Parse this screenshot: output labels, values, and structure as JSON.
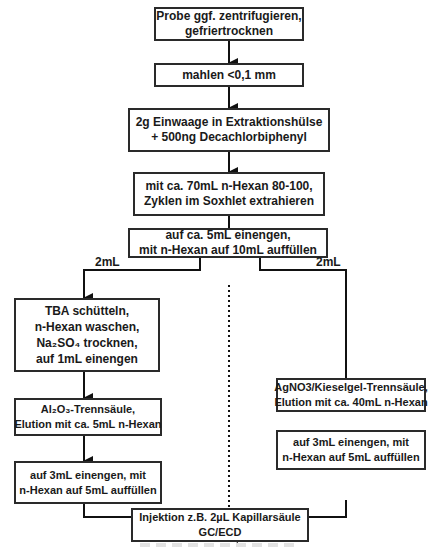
{
  "diagram": {
    "type": "flowchart",
    "steps": {
      "s1": [
        "Probe ggf. zentrifugieren,",
        "gefriertrocknen"
      ],
      "s2": [
        "mahlen <0,1 mm"
      ],
      "s3": [
        "2g Einwaage in Extraktionshülse",
        "+ 500ng Decachlorbiphenyl"
      ],
      "s4": [
        "mit ca. 70mL n-Hexan 80-100,",
        "Zyklen im Soxhlet extrahieren"
      ],
      "s5": [
        "auf ca. 5mL einengen,",
        "mit n-Hexan auf 10mL auffüllen"
      ],
      "left1": [
        "TBA schütteln,",
        "n-Hexan waschen,",
        "Na₂SO₄ trocknen,",
        "auf 1mL einengen"
      ],
      "left2": [
        "Al₂O₃-Trennsäule,",
        "Elution mit ca. 5mL n-Hexan"
      ],
      "left3": [
        "auf 3mL einengen, mit",
        "n-Hexan auf 5mL auffüllen"
      ],
      "right1": [
        "AgNO3/Kieselgel-Trennsäule,",
        "Elution mit ca. 40mL n-Hexan"
      ],
      "right2": [
        "auf 3mL einengen, mit",
        "n-Hexan auf 5mL auffüllen"
      ],
      "final": [
        "Injektion z.B. 2µL Kapillarsäule",
        "GC/ECD"
      ]
    },
    "branch_labels": {
      "left": "2mL",
      "right": "2mL"
    }
  }
}
